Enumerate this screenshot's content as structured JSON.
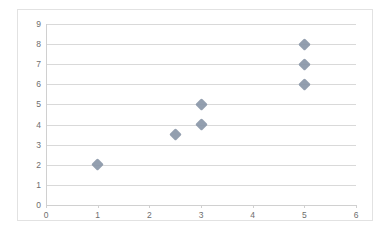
{
  "chart_data": {
    "type": "scatter",
    "title": "",
    "xlabel": "",
    "ylabel": "",
    "xlim": [
      0,
      6
    ],
    "ylim": [
      0,
      9
    ],
    "xticks": [
      0,
      1,
      2,
      3,
      4,
      5,
      6
    ],
    "yticks": [
      0,
      1,
      2,
      3,
      4,
      5,
      6,
      7,
      8,
      9
    ],
    "grid": "horizontal",
    "legend": "none",
    "marker": "diamond",
    "marker_color": "#8a97a8",
    "gridline_color": "#d9d9d9",
    "axis_color": "#d0d0d0",
    "tick_label_color": "#6e6e6e",
    "border_color": "#e2e2e2",
    "series": [
      {
        "name": "Series 1",
        "points": [
          {
            "x": 1,
            "y": 2
          },
          {
            "x": 2.5,
            "y": 3.5
          },
          {
            "x": 3,
            "y": 4
          },
          {
            "x": 3,
            "y": 5
          },
          {
            "x": 5,
            "y": 6
          },
          {
            "x": 5,
            "y": 7
          },
          {
            "x": 5,
            "y": 8
          }
        ]
      }
    ]
  }
}
